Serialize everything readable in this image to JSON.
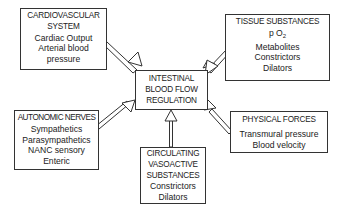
{
  "diagram": {
    "center": {
      "lines": [
        "INTESTINAL",
        "BLOOD FLOW",
        "REGULATION"
      ]
    },
    "cardiovascular": {
      "title_lines": [
        "CARDIOVASCULAR",
        "SYSTEM"
      ],
      "items": [
        "Cardiac Output",
        "Arterial blood",
        "pressure"
      ]
    },
    "tissue": {
      "title_lines": [
        "TISSUE SUBSTANCES"
      ],
      "po2_prefix": "p O",
      "po2_sub": "2",
      "items": [
        "Metabolites",
        "Constrictors",
        "Dilators"
      ]
    },
    "autonomic": {
      "title_lines": [
        "AUTONOMIC NERVES"
      ],
      "items": [
        "Sympathetics",
        "Parasympathetics",
        "NANC sensory",
        "Enteric"
      ]
    },
    "physical": {
      "title_lines": [
        "PHYSICAL FORCES"
      ],
      "items": [
        "Transmural pressure",
        "Blood velocity"
      ]
    },
    "circulating": {
      "title_lines": [
        "CIRCULATING",
        "VASOACTIVE",
        "SUBSTANCES"
      ],
      "items": [
        "Constrictors",
        "Dilators"
      ]
    },
    "colors": {
      "stroke": "#333333",
      "background": "#ffffff"
    }
  }
}
